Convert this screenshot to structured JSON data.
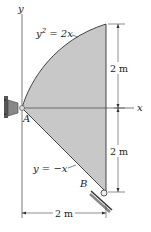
{
  "diagram": {
    "axes": {
      "x_label": "x",
      "y_label": "y"
    },
    "curves": {
      "upper": {
        "equation_lhs": "y",
        "equation_sup": "2",
        "equation_rhs": " = 2x"
      },
      "lower": {
        "equation": "y = −x"
      }
    },
    "points": {
      "A": "A",
      "B": "B"
    },
    "dimensions": {
      "upper_height": "2 m",
      "lower_height": "2 m",
      "width": "2 m"
    },
    "colors": {
      "fill": "#c8c8c8",
      "line": "#333333",
      "support": "#555555",
      "background": "#ffffff"
    }
  }
}
